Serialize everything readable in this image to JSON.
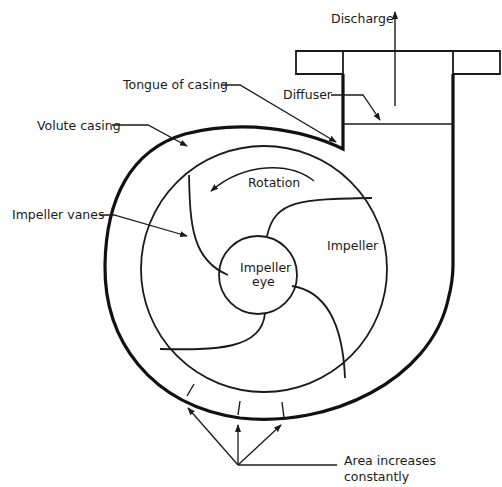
{
  "diagram": {
    "labels": {
      "discharge": "Discharge",
      "tongue": "Tongue of casing",
      "diffuser": "Diffuser",
      "volute_casing": "Volute casing",
      "rotation": "Rotation",
      "impeller_vanes": "Impeller vanes",
      "impeller": "Impeller",
      "impeller_eye_line1": "Impeller",
      "impeller_eye_line2": "eye",
      "area_line1": "Area increases",
      "area_line2": "constantly"
    },
    "colors": {
      "line": "#1a1a1a",
      "background": "#ffffff"
    }
  }
}
